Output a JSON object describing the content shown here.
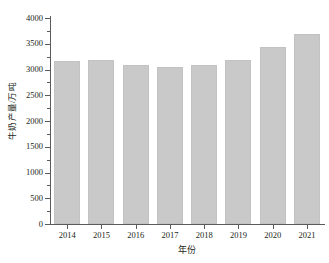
{
  "chart_data": {
    "type": "bar",
    "title": "",
    "xlabel": "年份",
    "ylabel": "牛奶产量/万吨",
    "categories": [
      "2014",
      "2015",
      "2016",
      "2017",
      "2018",
      "2019",
      "2020",
      "2021"
    ],
    "values": [
      3160,
      3180,
      3080,
      3040,
      3080,
      3180,
      3440,
      3680
    ],
    "ylim": [
      0,
      4000
    ],
    "ytick_labels": [
      "0",
      "500",
      "1000",
      "1500",
      "2000",
      "2500",
      "3000",
      "3500",
      "4000"
    ],
    "ytick_values": [
      0,
      500,
      1000,
      1500,
      2000,
      2500,
      3000,
      3500,
      4000
    ],
    "grid": false,
    "legend": null,
    "bar_color": "#c9c9c9",
    "axis_color": "#5b5b5b",
    "text_color": "#231f20"
  }
}
